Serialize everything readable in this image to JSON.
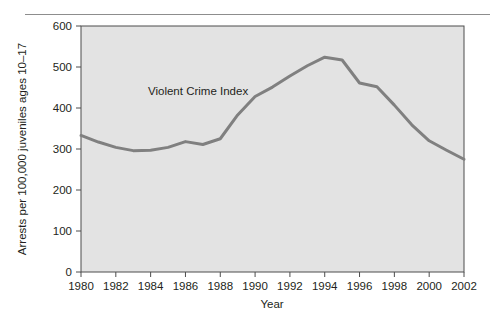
{
  "figure": {
    "background_color": "#ffffff",
    "plot_background_color": "#e3e3e3",
    "axis_color": "#4d4d4d",
    "line_color": "#808080",
    "text_color": "#231f20",
    "rule_color": "#8d8d8d"
  },
  "chart_data": {
    "type": "line",
    "title": "",
    "xlabel": "Year",
    "ylabel": "Arrests per 100,000 juveniles ages 10–17",
    "xlim": [
      1980,
      2002
    ],
    "ylim": [
      0,
      600
    ],
    "grid": false,
    "legend_position": "inline-annotation",
    "annotations": [
      {
        "text": "Violent Crime Index",
        "x": 1985.4,
        "y": 420
      }
    ],
    "xticks": [
      1980,
      1982,
      1984,
      1986,
      1988,
      1990,
      1992,
      1994,
      1996,
      1998,
      2000,
      2002
    ],
    "xtick_labels": [
      "1980",
      "1982",
      "1984",
      "1986",
      "1988",
      "1990",
      "1992",
      "1994",
      "1996",
      "1998",
      "2000",
      "2002"
    ],
    "yticks": [
      0,
      100,
      200,
      300,
      400,
      500,
      600
    ],
    "ytick_labels": [
      "0",
      "100",
      "200",
      "300",
      "400",
      "500",
      "600"
    ],
    "series": [
      {
        "name": "Violent Crime Index",
        "color": "#808080",
        "x": [
          1980,
          1981,
          1982,
          1983,
          1984,
          1985,
          1986,
          1987,
          1988,
          1989,
          1990,
          1991,
          1992,
          1993,
          1994,
          1995,
          1996,
          1997,
          1998,
          1999,
          2000,
          2001,
          2002
        ],
        "values": [
          333,
          317,
          304,
          296,
          297,
          304,
          318,
          311,
          325,
          383,
          428,
          451,
          478,
          503,
          524,
          517,
          461,
          452,
          407,
          359,
          320,
          297,
          275
        ]
      }
    ]
  }
}
